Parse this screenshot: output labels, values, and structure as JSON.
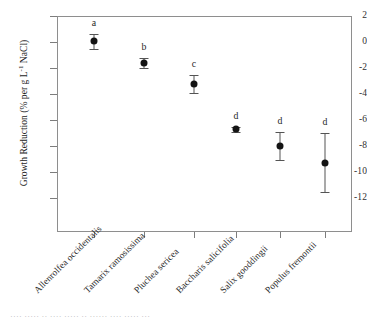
{
  "chart_data": {
    "type": "scatter",
    "title": "",
    "xlabel": "",
    "ylabel": "Growth Reduction (% per g L",
    "ylabel_sup": "-1",
    "ylabel_tail": " NaCl)",
    "ylim": [
      -14.6,
      2.0
    ],
    "yticks": [
      2,
      0,
      -2,
      -4,
      -6,
      -8,
      -10,
      -12
    ],
    "ytick_labels": [
      "2",
      "0",
      "-2",
      "-4",
      "-6",
      "-8",
      "-10",
      "-12"
    ],
    "grid": false,
    "legend": "none",
    "error_bar_type": "standard error",
    "categories": [
      "Allenrolfea occidentalis",
      "Tamarix ramosissima",
      "Pluchea sericea",
      "Baccharis salicifolia",
      "Salix gooddingii",
      "Populus fremontii"
    ],
    "values": [
      0.1,
      -1.6,
      -3.2,
      -6.7,
      -8.0,
      -9.3
    ],
    "err_low": [
      -0.5,
      -2.0,
      -3.9,
      -6.9,
      -9.1,
      -11.5
    ],
    "err_high": [
      0.6,
      -1.2,
      -2.5,
      -6.5,
      -6.9,
      -7.0
    ],
    "significance_letters": [
      "a",
      "b",
      "c",
      "d",
      "d",
      "d"
    ],
    "marker": "filled-circle",
    "marker_color": "#141414",
    "error_color": "#545454",
    "axis_color": "#8e8e8e"
  },
  "caption": {
    "text": "····  ·····   ··  ····   ·····  ··  ······  ····   ·····  ···"
  }
}
